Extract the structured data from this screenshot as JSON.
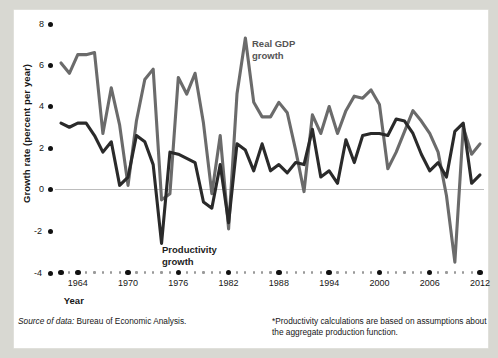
{
  "figure": {
    "background": "#ffffff",
    "page_background": "#d8d8d2"
  },
  "axes": {
    "y_title": "Growth rate (percent per year)",
    "x_title": "Year",
    "y_ticks": [
      "8",
      "6",
      "4",
      "2",
      "0",
      "-2",
      "-4"
    ],
    "x_ticks": [
      "1964",
      "1970",
      "1976",
      "1982",
      "1988",
      "1994",
      "2000",
      "2006",
      "2012"
    ]
  },
  "annotations": {
    "gdp": "Real GDP\ngrowth",
    "productivity": "Productivity\ngrowth"
  },
  "notes": {
    "source_lead": "Source of data:",
    "source_body": " Bureau of Economic Analysis.",
    "productivity_note": "*Productivity calculations are based on assumptions about the aggregate production function."
  },
  "colors": {
    "gdp_line": "#6b6b6b",
    "productivity_line": "#2a2a2a",
    "zero_line": "#bdbdbd",
    "tick_dot": "#111111",
    "minor_dot": "#9a9a9a"
  },
  "chart_data": {
    "type": "line",
    "title": "",
    "xlabel": "Year",
    "ylabel": "Growth rate (percent per year)",
    "xlim": [
      1962,
      2012
    ],
    "ylim": [
      -4,
      8
    ],
    "grid": false,
    "zero_line": true,
    "legend_position": "inline-annotation",
    "x": [
      1962,
      1963,
      1964,
      1965,
      1966,
      1967,
      1968,
      1969,
      1970,
      1971,
      1972,
      1973,
      1974,
      1975,
      1976,
      1977,
      1978,
      1979,
      1980,
      1981,
      1982,
      1983,
      1984,
      1985,
      1986,
      1987,
      1988,
      1989,
      1990,
      1991,
      1992,
      1993,
      1994,
      1995,
      1996,
      1997,
      1998,
      1999,
      2000,
      2001,
      2002,
      2003,
      2004,
      2005,
      2006,
      2007,
      2008,
      2009,
      2010,
      2011,
      2012
    ],
    "series": [
      {
        "name": "Real GDP growth",
        "color": "#6b6b6b",
        "values": [
          6.1,
          5.6,
          6.5,
          6.5,
          6.6,
          2.7,
          4.9,
          3.1,
          0.2,
          3.3,
          5.3,
          5.8,
          -0.5,
          -0.2,
          5.4,
          4.6,
          5.6,
          3.2,
          -0.2,
          2.6,
          -1.9,
          4.6,
          7.3,
          4.2,
          3.5,
          3.5,
          4.2,
          3.7,
          1.9,
          -0.1,
          3.6,
          2.7,
          4.0,
          2.7,
          3.8,
          4.5,
          4.4,
          4.8,
          4.1,
          1.0,
          1.8,
          2.8,
          3.8,
          3.3,
          2.7,
          1.8,
          -0.3,
          -3.5,
          3.0,
          1.7,
          2.2
        ]
      },
      {
        "name": "Productivity growth",
        "color": "#2a2a2a",
        "values": [
          3.2,
          3.0,
          3.2,
          3.2,
          2.6,
          1.8,
          2.3,
          0.2,
          0.6,
          2.6,
          2.3,
          1.2,
          -2.6,
          1.8,
          1.7,
          1.5,
          1.3,
          -0.6,
          -0.9,
          1.2,
          -1.6,
          2.2,
          1.9,
          0.9,
          2.2,
          0.9,
          1.2,
          0.8,
          1.3,
          1.2,
          2.9,
          0.6,
          0.9,
          0.3,
          2.4,
          1.3,
          2.6,
          2.7,
          2.7,
          2.6,
          3.4,
          3.3,
          2.7,
          1.7,
          0.9,
          1.3,
          0.6,
          2.8,
          3.2,
          0.3,
          0.7
        ]
      }
    ]
  }
}
